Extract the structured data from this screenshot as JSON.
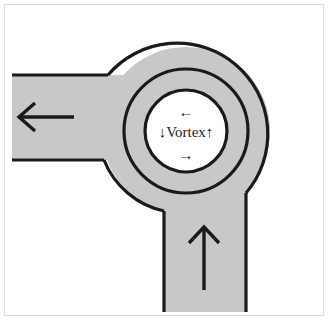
{
  "figure": {
    "background_color": "#ffffff",
    "border_color": "#dcdcdc",
    "road_fill_color": "#c8c8c8",
    "outline_color": "#1a1a1a",
    "island_fill_color": "#ffffff"
  },
  "center": {
    "label_text": "Vortex",
    "label_prefix_arrow": "↓",
    "label_suffix_arrow": "↑",
    "top_arrow": "←",
    "bottom_arrow": "→"
  },
  "branches": {
    "west": {
      "name": "west-branch",
      "arrow": "←",
      "direction": "outbound-left"
    },
    "south": {
      "name": "south-branch",
      "arrow": "↑",
      "direction": "inbound-up"
    }
  },
  "geometry": {
    "outer_circle": {
      "cx": 186,
      "cy": 131,
      "r": 84
    },
    "ring_circle": {
      "cx": 186,
      "cy": 131,
      "r": 62
    },
    "island_circle": {
      "cx": 186,
      "cy": 131,
      "r": 41
    },
    "west_road": {
      "top": 75,
      "bottom": 160,
      "left": 12
    },
    "south_road": {
      "left": 163,
      "right": 246,
      "bottom": 312
    }
  }
}
